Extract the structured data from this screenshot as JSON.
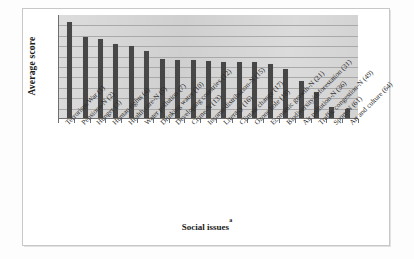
{
  "figure": {
    "y_axis_title": "Average score",
    "x_axis_title": "Social issues",
    "x_axis_title_superscript": "a"
  },
  "chart_data": {
    "type": "bar",
    "title": "",
    "xlabel": "Social issues",
    "ylabel": "Average score",
    "grid": true,
    "gridlines": 9,
    "legend": "none",
    "ylim": [
      0,
      9
    ],
    "y_tick_labels": [],
    "bar_color": "#474747",
    "plot_background": "#d6d6d6",
    "categories": [
      "(1) Terrorism/War",
      "(2) Pensions-N",
      "(3) Hunger",
      "(4) Human rights",
      "(5) Health care-N",
      "(7) Water pollution",
      "(10) Drinking water",
      "(12) Developing countries",
      "(13) Crime-N",
      "(15) Income distribution-N",
      "(16) Literacy",
      "(17) Climate change",
      "(18) Ozone hole",
      "(21) Economic growth-N",
      "(31) Biodiversity/deforestation",
      "(36) Air pollution-N",
      "(49) Traffic congestion-N",
      "(61) Sport-N",
      "(64) Art and culture"
    ],
    "values": [
      8.6,
      7.3,
      7.1,
      6.7,
      6.5,
      6.0,
      5.3,
      5.25,
      5.2,
      5.1,
      5.0,
      5.0,
      5.0,
      4.9,
      4.4,
      3.3,
      2.3,
      1.0,
      0.8
    ]
  }
}
